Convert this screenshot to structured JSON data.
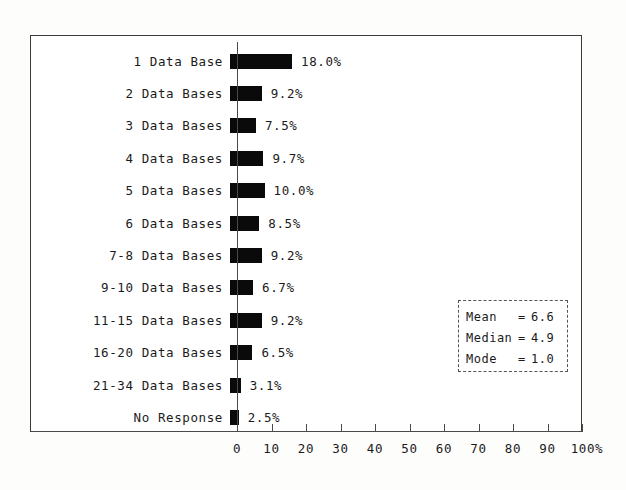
{
  "chart_data": {
    "type": "bar",
    "orientation": "horizontal",
    "title": "",
    "subtitle": "",
    "xlabel": "",
    "ylabel": "",
    "xlim": [
      0,
      100
    ],
    "grid": false,
    "legend_position": "inside-right",
    "categories": [
      "1 Data Base",
      "2 Data Bases",
      "3 Data Bases",
      "4 Data Bases",
      "5 Data Bases",
      "6 Data Bases",
      "7-8 Data Bases",
      "9-10 Data Bases",
      "11-15 Data Bases",
      "16-20 Data Bases",
      "21-34 Data Bases",
      "No Response"
    ],
    "values": [
      18.0,
      9.2,
      7.5,
      9.7,
      10.0,
      8.5,
      9.2,
      6.7,
      9.2,
      6.5,
      3.1,
      2.5
    ],
    "value_labels": [
      "18.0%",
      "9.2%",
      "7.5%",
      "9.7%",
      "10.0%",
      "8.5%",
      "9.2%",
      "6.7%",
      "9.2%",
      "6.5%",
      "3.1%",
      "2.5%"
    ],
    "xticks": [
      0,
      10,
      20,
      30,
      40,
      50,
      60,
      70,
      80,
      90,
      100
    ],
    "xtick_labels": [
      "0",
      "10",
      "20",
      "30",
      "40",
      "50",
      "60",
      "70",
      "80",
      "90",
      "100%"
    ],
    "bar_color": "#0a0a0a",
    "axis_color": "#4a4a4a"
  },
  "stats": {
    "rows": [
      {
        "name": "Mean",
        "eq": "=",
        "value": "6.6"
      },
      {
        "name": "Median",
        "eq": "=",
        "value": "4.9"
      },
      {
        "name": "Mode",
        "eq": "=",
        "value": "1.0"
      }
    ]
  }
}
